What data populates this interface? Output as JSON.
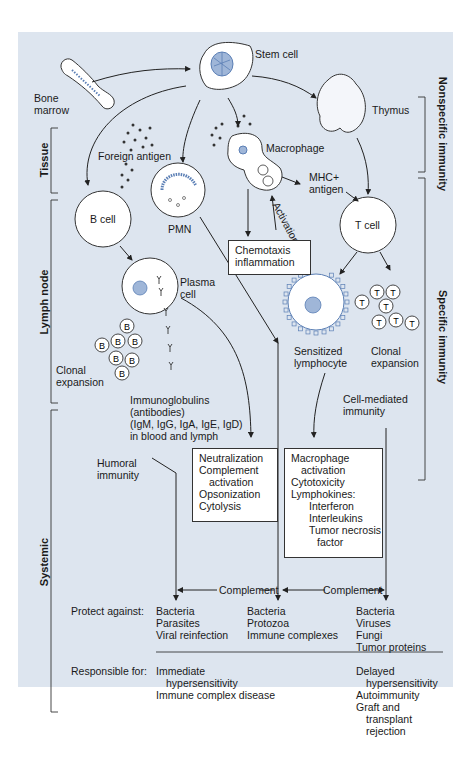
{
  "diagram": {
    "colors": {
      "panel_background": "#dde5ef",
      "cell_fill": "#ffffff",
      "line": "#333333",
      "nucleus": "#5b7fb5"
    },
    "labels": {
      "bone_marrow": [
        "Bone",
        "marrow"
      ],
      "stem_cell": "Stem cell",
      "thymus": "Thymus",
      "foreign_antigen": "Foreign antigen",
      "macrophage": "Macrophage",
      "mhc_antigen": [
        "MHC+",
        "antigen"
      ],
      "b_cell": "B cell",
      "pmn": "PMN",
      "t_cell": "T cell",
      "activation": "Activation",
      "plasma_cell": [
        "Plasma",
        "cell"
      ],
      "sensitized_lymphocyte": [
        "Sensitized",
        "lymphocyte"
      ],
      "clonal_expansion_b": [
        "Clonal",
        "expansion"
      ],
      "clonal_expansion_t": [
        "Clonal",
        "expansion"
      ],
      "b_clone_letter": "B",
      "t_clone_letter": "T",
      "immunoglobulins": [
        "Immunoglobulins",
        "(antibodies)",
        "(IgM, IgG, IgA, IgE, IgD)",
        "in blood and lymph"
      ],
      "humoral_immunity": [
        "Humoral",
        "immunity"
      ],
      "cell_mediated_immunity": [
        "Cell-mediated",
        "immunity"
      ],
      "complement_left": "Complement",
      "complement_right": "Complement",
      "protect_against": "Protect against:",
      "responsible_for": "Responsible for:"
    },
    "boxes": {
      "chemotaxis": [
        "Chemotaxis",
        "inflammation"
      ],
      "humoral_functions": [
        {
          "text": "Neutralization",
          "indent": 0
        },
        {
          "text": "Complement",
          "indent": 0
        },
        {
          "text": "activation",
          "indent": 1
        },
        {
          "text": "Opsonization",
          "indent": 0
        },
        {
          "text": "Cytolysis",
          "indent": 0
        }
      ],
      "cell_functions": [
        {
          "text": "Macrophage",
          "indent": 0
        },
        {
          "text": "activation",
          "indent": 1
        },
        {
          "text": "Cytotoxicity",
          "indent": 0
        },
        {
          "text": "Lymphokines:",
          "indent": 0
        },
        {
          "text": "Interferon",
          "indent": 2
        },
        {
          "text": "Interleukins",
          "indent": 2
        },
        {
          "text": "Tumor necrosis",
          "indent": 2
        },
        {
          "text": "factor",
          "indent": 3
        }
      ]
    },
    "protect_against": {
      "humoral": [
        "Bacteria",
        "Parasites",
        "Viral reinfection"
      ],
      "nonspecific": [
        "Bacteria",
        "Protozoa",
        "Immune complexes"
      ],
      "cell_mediated": [
        "Bacteria",
        "Viruses",
        "Fungi",
        "Tumor proteins"
      ]
    },
    "responsible_for": {
      "humoral": [
        {
          "text": "Immediate",
          "indent": 0
        },
        {
          "text": "hypersensitivity",
          "indent": 1
        },
        {
          "text": "Immune complex disease",
          "indent": 0
        }
      ],
      "cell_mediated": [
        {
          "text": "Delayed",
          "indent": 0
        },
        {
          "text": "hypersensitivity",
          "indent": 1
        },
        {
          "text": "Autoimmunity",
          "indent": 0
        },
        {
          "text": "Graft and",
          "indent": 0
        },
        {
          "text": "transplant",
          "indent": 1
        },
        {
          "text": "rejection",
          "indent": 1
        }
      ]
    },
    "side_brackets": {
      "left": [
        "Tissue",
        "Lymph node",
        "Systemic"
      ],
      "right": [
        "Nonspecific immunity",
        "Specific immunity"
      ]
    }
  }
}
